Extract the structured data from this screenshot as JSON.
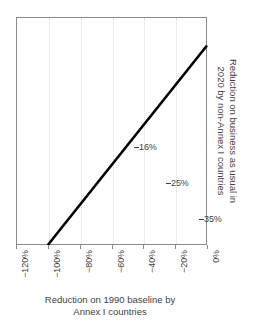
{
  "chart_data": {
    "type": "line",
    "title": "",
    "xlabel": "Reduction on 1990 baseline by Annex I countries",
    "xlabel_line1": "Reduction on 1990 baseline by",
    "xlabel_line2": "Annex I countries",
    "ylabel": "Reduction on business as usual in 2020 by non-Annex I countries",
    "ylabel_line1": "Reduction on business as usual in",
    "ylabel_line2": "2020 by non-Annex I countries",
    "xlim": [
      -120,
      0
    ],
    "ylim": [
      0,
      40
    ],
    "xticks": [
      -120,
      -100,
      -80,
      -60,
      -40,
      -20,
      0
    ],
    "xticklabels": [
      "−120%",
      "−100%",
      "−80%",
      "−60%",
      "−40%",
      "−20%",
      "0%"
    ],
    "yticks": [],
    "yticklabels": [],
    "grid": "vertical-dotted",
    "legend": "none",
    "series": [
      {
        "name": "Required non-Annex I reduction",
        "x": [
          -100,
          0
        ],
        "y": [
          0,
          35
        ],
        "color": "#000000",
        "linewidth": 2.6
      }
    ],
    "annotations": [
      {
        "label": "16%",
        "x": -45,
        "y": 16
      },
      {
        "label": "25%",
        "x": -25,
        "y": 25
      },
      {
        "label": "35%",
        "x": 0,
        "y": 35
      }
    ],
    "colors": {
      "line": "#000000",
      "frame": "#8a8a8a",
      "grid": "#d8d8d8",
      "text": "#3f3f3f",
      "background": "#ffffff"
    }
  }
}
